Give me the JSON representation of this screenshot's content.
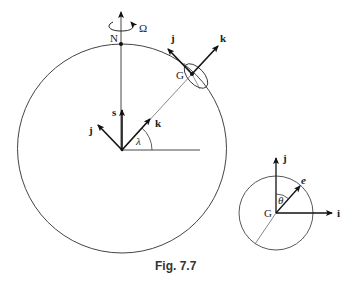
{
  "figure": {
    "caption": "Fig. 7.7",
    "main": {
      "north_label": "N",
      "rotation_label": "Ω",
      "origin_vectors": {
        "s_label": "s",
        "j_label": "j",
        "k_label": "k",
        "angle_label": "λ"
      },
      "point_label": "G",
      "surface_vectors": {
        "j_label": "j",
        "k_label": "k"
      }
    },
    "inset": {
      "center_label": "G",
      "j_label": "j",
      "i_label": "i",
      "e_label": "e",
      "angle_label": "θ"
    }
  }
}
